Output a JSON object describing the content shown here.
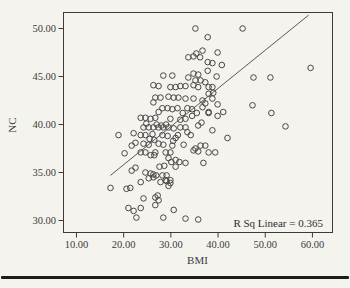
{
  "figure": {
    "background": "#f5f3ee",
    "ink_color": "#3b3b3b",
    "marker_color": "#474747",
    "line_color": "#5a5a5a",
    "rule_color": "#1c1c1c"
  },
  "chart_data": {
    "type": "scatter",
    "title": "",
    "xlabel": "BMI",
    "ylabel": "NC",
    "annotation": "R Sq Linear = 0.365",
    "r_squared": 0.365,
    "grid": false,
    "legend": "none",
    "x_tick_labels": [
      "10.00",
      "20.00",
      "30.00",
      "40.00",
      "50.00",
      "60.00"
    ],
    "y_tick_labels": [
      "30.00",
      "35.00",
      "40.00",
      "45.00",
      "50.00"
    ],
    "x_tick_values": [
      10,
      20,
      30,
      40,
      50,
      60
    ],
    "y_tick_values": [
      30,
      35,
      40,
      45,
      50
    ],
    "xlim": [
      7.25,
      64.25
    ],
    "ylim": [
      28.75,
      51.67
    ],
    "regression_line": {
      "x": [
        17.2,
        59.2
      ],
      "y": [
        34.7,
        51.4
      ]
    },
    "points": [
      [
        35.2,
        50.0
      ],
      [
        45.2,
        50.0
      ],
      [
        37.8,
        49.1
      ],
      [
        39.9,
        47.5
      ],
      [
        33.7,
        47.0
      ],
      [
        34.8,
        47.1
      ],
      [
        36.2,
        47.0
      ],
      [
        35.4,
        47.4
      ],
      [
        36.7,
        47.7
      ],
      [
        40.8,
        46.2
      ],
      [
        37.8,
        46.5
      ],
      [
        38.8,
        46.4
      ],
      [
        59.6,
        45.9
      ],
      [
        51.1,
        44.9
      ],
      [
        47.5,
        44.9
      ],
      [
        28.4,
        45.1
      ],
      [
        30.3,
        45.1
      ],
      [
        33.7,
        44.9
      ],
      [
        34.8,
        45.3
      ],
      [
        35.8,
        45.2
      ],
      [
        37.8,
        45.6
      ],
      [
        39.7,
        45.0
      ],
      [
        35.2,
        44.6
      ],
      [
        36.3,
        44.6
      ],
      [
        37.3,
        44.4
      ],
      [
        26.3,
        44.1
      ],
      [
        27.4,
        44.0
      ],
      [
        29.9,
        43.9
      ],
      [
        31.0,
        43.9
      ],
      [
        32.0,
        44.0
      ],
      [
        33.1,
        44.0
      ],
      [
        34.8,
        44.1
      ],
      [
        35.8,
        43.9
      ],
      [
        38.0,
        43.9
      ],
      [
        38.8,
        43.9
      ],
      [
        39.0,
        43.3
      ],
      [
        38.0,
        43.2
      ],
      [
        26.7,
        42.8
      ],
      [
        27.8,
        42.8
      ],
      [
        29.5,
        42.9
      ],
      [
        30.6,
        42.8
      ],
      [
        31.6,
        42.8
      ],
      [
        33.1,
        42.7
      ],
      [
        34.8,
        42.7
      ],
      [
        38.8,
        42.7
      ],
      [
        36.7,
        42.5
      ],
      [
        26.3,
        42.3
      ],
      [
        37.3,
        42.2
      ],
      [
        47.3,
        42.0
      ],
      [
        39.9,
        42.1
      ],
      [
        28.2,
        41.7
      ],
      [
        29.3,
        41.7
      ],
      [
        30.3,
        41.6
      ],
      [
        31.4,
        41.7
      ],
      [
        27.4,
        41.3
      ],
      [
        36.7,
        41.8
      ],
      [
        38.0,
        41.2
      ],
      [
        39.9,
        40.9
      ],
      [
        38.0,
        41.3
      ],
      [
        41.1,
        41.3
      ],
      [
        51.3,
        41.2
      ],
      [
        33.5,
        41.7
      ],
      [
        34.5,
        41.6
      ],
      [
        35.5,
        41.2
      ],
      [
        32.5,
        41.2
      ],
      [
        34.5,
        40.9
      ],
      [
        23.6,
        40.7
      ],
      [
        24.6,
        40.7
      ],
      [
        25.7,
        40.6
      ],
      [
        26.7,
        40.7
      ],
      [
        29.9,
        40.6
      ],
      [
        32.0,
        40.5
      ],
      [
        33.1,
        40.6
      ],
      [
        36.5,
        40.2
      ],
      [
        24.8,
        40.1
      ],
      [
        27.0,
        40.0
      ],
      [
        28.0,
        39.9
      ],
      [
        29.0,
        40.0
      ],
      [
        25.3,
        39.7
      ],
      [
        26.3,
        39.7
      ],
      [
        27.4,
        39.7
      ],
      [
        28.4,
        39.7
      ],
      [
        29.5,
        39.7
      ],
      [
        30.6,
        39.6
      ],
      [
        32.0,
        39.7
      ],
      [
        33.1,
        39.7
      ],
      [
        35.8,
        39.9
      ],
      [
        24.2,
        39.7
      ],
      [
        54.3,
        39.8
      ],
      [
        38.8,
        39.4
      ],
      [
        33.5,
        39.2
      ],
      [
        31.5,
        38.9
      ],
      [
        23.6,
        38.9
      ],
      [
        24.6,
        38.9
      ],
      [
        26.1,
        39.0
      ],
      [
        28.2,
        38.9
      ],
      [
        29.3,
        38.8
      ],
      [
        31.0,
        38.6
      ],
      [
        34.2,
        38.9
      ],
      [
        18.9,
        38.9
      ],
      [
        22.1,
        39.1
      ],
      [
        42.0,
        38.6
      ],
      [
        25.5,
        38.5
      ],
      [
        26.5,
        38.4
      ],
      [
        30.5,
        38.3
      ],
      [
        24.2,
        38.0
      ],
      [
        25.3,
        37.9
      ],
      [
        27.4,
        38.0
      ],
      [
        28.4,
        37.9
      ],
      [
        30.3,
        37.8
      ],
      [
        32.7,
        37.9
      ],
      [
        36.3,
        37.8
      ],
      [
        37.3,
        37.8
      ],
      [
        22.5,
        38.1
      ],
      [
        21.7,
        37.8
      ],
      [
        23.6,
        37.1
      ],
      [
        24.6,
        37.1
      ],
      [
        26.7,
        37.1
      ],
      [
        28.9,
        37.1
      ],
      [
        29.9,
        37.1
      ],
      [
        34.8,
        37.3
      ],
      [
        35.8,
        37.2
      ],
      [
        39.4,
        37.1
      ],
      [
        35.2,
        37.5
      ],
      [
        38.0,
        37.1
      ],
      [
        25.7,
        36.8
      ],
      [
        26.5,
        36.8
      ],
      [
        20.2,
        37.0
      ],
      [
        29.5,
        36.5
      ],
      [
        30.1,
        36.1
      ],
      [
        31.0,
        36.3
      ],
      [
        31.8,
        36.1
      ],
      [
        33.1,
        36.0
      ],
      [
        36.9,
        36.0
      ],
      [
        27.6,
        35.6
      ],
      [
        28.6,
        35.7
      ],
      [
        31.0,
        35.6
      ],
      [
        21.7,
        35.2
      ],
      [
        22.5,
        35.5
      ],
      [
        24.6,
        35.0
      ],
      [
        25.7,
        34.9
      ],
      [
        26.3,
        34.8
      ],
      [
        28.2,
        34.7
      ],
      [
        29.1,
        34.7
      ],
      [
        25.3,
        34.4
      ],
      [
        26.3,
        34.5
      ],
      [
        26.9,
        34.7
      ],
      [
        27.8,
        34.0
      ],
      [
        28.9,
        34.2
      ],
      [
        29.9,
        33.9
      ],
      [
        29.9,
        34.2
      ],
      [
        29.1,
        34.1
      ],
      [
        29.5,
        33.6
      ],
      [
        23.6,
        34.0
      ],
      [
        17.2,
        33.4
      ],
      [
        20.6,
        33.3
      ],
      [
        21.4,
        33.4
      ],
      [
        24.2,
        32.3
      ],
      [
        26.7,
        32.4
      ],
      [
        27.2,
        32.6
      ],
      [
        27.4,
        32.1
      ],
      [
        26.7,
        31.6
      ],
      [
        21.0,
        31.3
      ],
      [
        22.1,
        31.0
      ],
      [
        23.6,
        31.3
      ],
      [
        22.7,
        30.3
      ],
      [
        28.4,
        30.3
      ],
      [
        33.1,
        30.2
      ],
      [
        30.6,
        31.1
      ],
      [
        35.8,
        30.1
      ]
    ]
  },
  "layout_px": {
    "plot_left": 63.5,
    "plot_top": 12.5,
    "plot_width": 269,
    "plot_height": 220,
    "tick_len": 5
  }
}
